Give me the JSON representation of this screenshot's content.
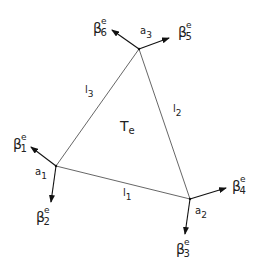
{
  "diagram": {
    "triangle_label": "T",
    "triangle_label_sub": "e",
    "vertices": [
      {
        "id": "a1",
        "label": "a",
        "sub": "1"
      },
      {
        "id": "a2",
        "label": "a",
        "sub": "2"
      },
      {
        "id": "a3",
        "label": "a",
        "sub": "3"
      }
    ],
    "edges": [
      {
        "id": "l1",
        "label": "l",
        "sub": "1"
      },
      {
        "id": "l2",
        "label": "l",
        "sub": "2"
      },
      {
        "id": "l3",
        "label": "l",
        "sub": "3"
      }
    ],
    "vectors": [
      {
        "id": "beta1",
        "label": "β",
        "sup": "e",
        "sub": "1"
      },
      {
        "id": "beta2",
        "label": "β",
        "sup": "e",
        "sub": "2"
      },
      {
        "id": "beta3",
        "label": "β",
        "sup": "e",
        "sub": "3"
      },
      {
        "id": "beta4",
        "label": "β",
        "sup": "e",
        "sub": "4"
      },
      {
        "id": "beta5",
        "label": "β",
        "sup": "e",
        "sub": "5"
      },
      {
        "id": "beta6",
        "label": "β",
        "sup": "e",
        "sub": "6"
      }
    ]
  }
}
